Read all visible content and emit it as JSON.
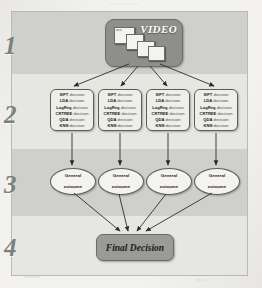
{
  "figure": {
    "background_color": "#f3f2f0",
    "frame_color": "#e9e9e6",
    "band_dark": "#cfcfcb",
    "band_light": "#e6e6e2"
  },
  "stages": [
    {
      "number": "1",
      "name": "video-input"
    },
    {
      "number": "2",
      "name": "classifier-decisions"
    },
    {
      "number": "3",
      "name": "general-outcomes"
    },
    {
      "number": "4",
      "name": "final-decision"
    }
  ],
  "video_node": {
    "label": "VIDEO",
    "frame_thumb_text": "face",
    "fill_color": "#8e8e8c",
    "label_color": "#ffffff"
  },
  "decision_boxes": [
    {
      "id": "decision-box-1",
      "lines": [
        {
          "method": "SIFT",
          "action": "decision"
        },
        {
          "method": "LDA",
          "action": "decision"
        },
        {
          "method": "LogReg",
          "action": "decision"
        },
        {
          "method": "CRTREE",
          "action": "decision"
        },
        {
          "method": "QDA",
          "action": "decision"
        },
        {
          "method": "KNN",
          "action": "decision"
        }
      ]
    },
    {
      "id": "decision-box-2",
      "lines": [
        {
          "method": "SIFT",
          "action": "decision"
        },
        {
          "method": "LDA",
          "action": "decision"
        },
        {
          "method": "LogReg",
          "action": "decision"
        },
        {
          "method": "CRTREE",
          "action": "decision"
        },
        {
          "method": "QDA",
          "action": "decision"
        },
        {
          "method": "KNN",
          "action": "decision"
        }
      ]
    },
    {
      "id": "decision-box-3",
      "lines": [
        {
          "method": "SIFT",
          "action": "decision"
        },
        {
          "method": "LDA",
          "action": "decision"
        },
        {
          "method": "LogReg",
          "action": "decision"
        },
        {
          "method": "CRTREE",
          "action": "decision"
        },
        {
          "method": "QDA",
          "action": "decision"
        },
        {
          "method": "KNN",
          "action": "decision"
        }
      ]
    },
    {
      "id": "decision-box-4",
      "lines": [
        {
          "method": "SIFT",
          "action": "decision"
        },
        {
          "method": "LDA",
          "action": "decision"
        },
        {
          "method": "LogReg",
          "action": "decision"
        },
        {
          "method": "CRTREE",
          "action": "decision"
        },
        {
          "method": "QDA",
          "action": "decision"
        },
        {
          "method": "KNN",
          "action": "decision"
        }
      ]
    }
  ],
  "outcomes": [
    {
      "id": "outcome-1",
      "line1": "General",
      "line2": "outcome"
    },
    {
      "id": "outcome-2",
      "line1": "General",
      "line2": "outcome"
    },
    {
      "id": "outcome-3",
      "line1": "General",
      "line2": "outcome"
    },
    {
      "id": "outcome-4",
      "line1": "General",
      "line2": "outcome"
    }
  ],
  "final_decision": {
    "label": "Final Decision",
    "fill_color": "#9a9a97"
  }
}
